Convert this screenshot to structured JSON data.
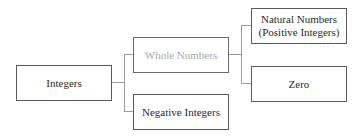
{
  "diagram": {
    "type": "hierarchy",
    "nodes": [
      {
        "id": "integers",
        "label": "Integers"
      },
      {
        "id": "whole_numbers",
        "label": "Whole Numbers",
        "style": "muted"
      },
      {
        "id": "negative_integers",
        "label": "Negative Integers"
      },
      {
        "id": "natural_numbers",
        "label_line1": "Natural Numbers",
        "label_line2": "(Positive Integers)"
      },
      {
        "id": "zero",
        "label": "Zero"
      }
    ],
    "edges": [
      {
        "from": "integers",
        "to": "whole_numbers"
      },
      {
        "from": "integers",
        "to": "negative_integers"
      },
      {
        "from": "whole_numbers",
        "to": "natural_numbers"
      },
      {
        "from": "whole_numbers",
        "to": "zero"
      }
    ],
    "colors": {
      "border": "#5a5a5a",
      "text": "#2a2a2a",
      "muted_text": "#a8a8a8",
      "connector": "#9a9a9a"
    }
  }
}
